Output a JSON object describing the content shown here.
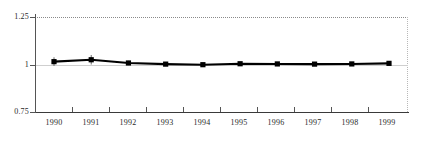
{
  "chart_data": {
    "type": "line",
    "title": "",
    "subtitle": "",
    "xlabel": "",
    "ylabel": "",
    "categories": [
      "1990",
      "1991",
      "1992",
      "1993",
      "1994",
      "1995",
      "1996",
      "1997",
      "1998",
      "1999"
    ],
    "x": [
      1990,
      1991,
      1992,
      1993,
      1994,
      1995,
      1996,
      1997,
      1998,
      1999
    ],
    "values": [
      1.015,
      1.025,
      1.008,
      1.002,
      0.999,
      1.004,
      1.003,
      1.002,
      1.003,
      1.006
    ],
    "error_low": [
      0.992,
      1.0,
      0.997,
      0.994,
      0.991,
      0.996,
      0.995,
      0.995,
      0.996,
      0.998
    ],
    "error_high": [
      1.038,
      1.05,
      1.019,
      1.01,
      1.007,
      1.012,
      1.011,
      1.009,
      1.01,
      1.014
    ],
    "series": [
      {
        "name": "index",
        "values": [
          1.015,
          1.025,
          1.008,
          1.002,
          0.999,
          1.004,
          1.003,
          1.002,
          1.003,
          1.006
        ]
      }
    ],
    "ylim": [
      0.75,
      1.25
    ],
    "yticks": [
      0.75,
      1,
      1.25
    ],
    "ytick_labels": [
      "0.75",
      "1",
      "1.25"
    ],
    "xlim": [
      1989.5,
      1999.8
    ],
    "grid": true,
    "gridlines": [
      "top-dotted-1.25",
      "mid-solid-1.00",
      "right-dotted-border"
    ],
    "legend": false,
    "legend_position": "none",
    "marker": "square",
    "error_bars": true,
    "colors": {
      "line": "#000000",
      "marker": "#000000",
      "errorbar": "#6d6d6d",
      "axis": "#3a3a3a",
      "grid_top": "#8a8a8a",
      "grid_mid": "#cfcfcf",
      "grid_right": "#b8b8b8",
      "text": "#2a2a2a",
      "background": "#ffffff"
    }
  },
  "axes": {
    "y_labels": [
      "1.25",
      "1",
      "0.75"
    ],
    "x_labels": [
      "1990",
      "1991",
      "1992",
      "1993",
      "1994",
      "1995",
      "1996",
      "1997",
      "1998",
      "1999"
    ]
  }
}
